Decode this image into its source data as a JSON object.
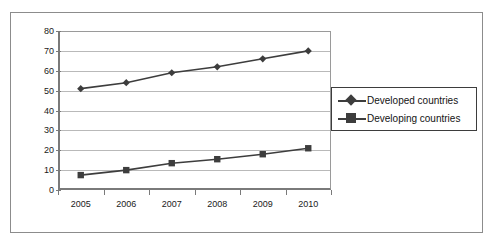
{
  "top_clip_text": "",
  "chart_data": {
    "type": "line",
    "title": "",
    "subtitle": "",
    "xlabel": "",
    "ylabel": "",
    "categories": [
      "2005",
      "2006",
      "2007",
      "2008",
      "2009",
      "2010"
    ],
    "x": [
      2005,
      2006,
      2007,
      2008,
      2009,
      2010
    ],
    "series": [
      {
        "name": "Developed countries",
        "marker": "diamond",
        "color": "#3d3d3d",
        "values": [
          51,
          54,
          59,
          62,
          66,
          70
        ]
      },
      {
        "name": "Developing countries",
        "marker": "square",
        "color": "#3d3d3d",
        "values": [
          7.5,
          10,
          13.5,
          15.5,
          18,
          21
        ]
      }
    ],
    "ylim": [
      0,
      80
    ],
    "ytick_step": 10,
    "yticks": [
      "0",
      "10",
      "20",
      "30",
      "40",
      "50",
      "60",
      "70",
      "80"
    ],
    "xticks": [
      "2005",
      "2006",
      "2007",
      "2008",
      "2009",
      "2010"
    ],
    "grid": "horizontal",
    "legend_position": "center-right",
    "legend_entries": [
      "Developed countries",
      "Developing countries"
    ],
    "plot_background": "#ffffff",
    "gridline_color": "#b9b9b9",
    "axis_color": "#7a7a7a",
    "frame_color": "#8c8c8c"
  }
}
